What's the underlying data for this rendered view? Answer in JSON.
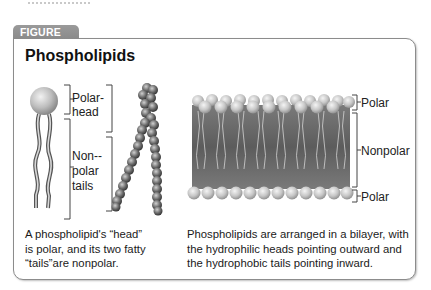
{
  "figure": {
    "tab_label": "FIGURE 1.6",
    "title": "Phospholipids"
  },
  "left_panel": {
    "labels": {
      "polar_head_line1": "Polar-",
      "polar_head_line2": "head",
      "nonpolar_line1": "Non--",
      "nonpolar_line2": "polar",
      "nonpolar_line3": "tails"
    },
    "caption_lines": [
      "A phospholipid's “head”",
      "is polar, and its two fatty",
      "“tails”are nonpolar."
    ]
  },
  "right_panel": {
    "labels": {
      "top": "Polar",
      "middle": "Nonpolar",
      "bottom": "Polar"
    },
    "caption_lines": [
      "Phospholipids are arranged in a bilayer, with",
      "the hydrophilic heads pointing outward and",
      "the hydrophobic tails pointing inward."
    ]
  },
  "colors": {
    "tab_bg": "#8f8f8f",
    "border": "#8c8c8c",
    "bilayer_core": "#6e6e6e",
    "head_sphere": "#c8c8c8"
  }
}
